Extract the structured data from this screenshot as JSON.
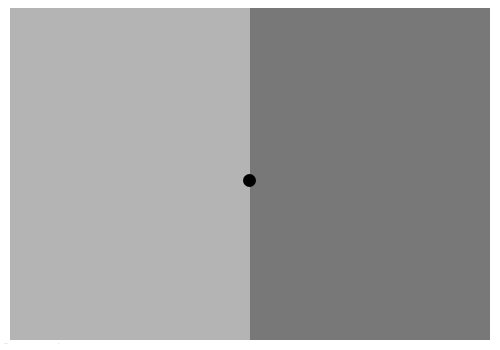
{
  "stimulus": {
    "left_panel_color": "#b4b4b4",
    "right_panel_color": "#787878",
    "fixation_dot_color": "#000000"
  },
  "footer": {
    "mark_left": "···",
    "mark_right": "·"
  }
}
